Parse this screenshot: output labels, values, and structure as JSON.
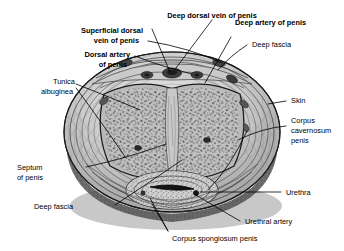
{
  "figure": {
    "type": "anatomical-cross-section",
    "background_color": "#ffffff",
    "line_color": "#000000"
  },
  "labels": {
    "deep_dorsal_vein": "Deep dorsal vein of penis",
    "superficial_dorsal_vein_l1": "Superficial dorsal",
    "superficial_dorsal_vein_l2": "vein of penis",
    "dorsal_artery_l1": "Dorsal artery",
    "dorsal_artery_l2": "of penis",
    "deep_artery": "Deep artery of penis",
    "deep_fascia_top": "Deep fascia",
    "tunica_albuginea_l1": "Tunica",
    "tunica_albuginea_l2": "albuginea",
    "skin": "Skin",
    "corpus_cavernosum_l1": "Corpus",
    "corpus_cavernosum_l2": "cavernosum",
    "corpus_cavernosum_l3": "penis",
    "septum_l1": "Septum",
    "septum_l2": "of penis",
    "urethra": "Urethra",
    "deep_fascia_bottom": "Deep fascia",
    "urethral_artery": "Urethral artery",
    "corpus_spongiosum": "Corpus spongiosum penis"
  },
  "structures": {
    "skin_outer": "outer oval disc",
    "deep_fascia_ring": "concentric fascial layers",
    "corpora_cavernosa": "paired erectile bodies with trabecular texture",
    "corpus_spongiosum": "ventral erectile body",
    "urethra_lumen": "central slit",
    "dorsal_bundle": "deep dorsal vein flanked by dorsal arteries and nerves",
    "septum": "midline vertical band"
  },
  "colors": {
    "tissue_light": "#cfcfcf",
    "tissue_mid": "#a8a8a8",
    "tissue_dark": "#6f6f6f",
    "shadow": "#4a4a4a",
    "stroke": "#111111"
  }
}
